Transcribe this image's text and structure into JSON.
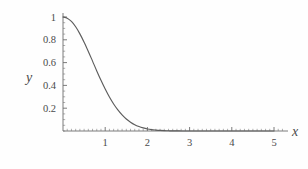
{
  "figure": {
    "background_color": "#fefefe",
    "curve_color": "#5c5c5c",
    "axis_color": "#6d6d6d",
    "text_color": "#4a4a4a"
  },
  "chart_data": {
    "type": "line",
    "title": "",
    "subtitle": "",
    "xlabel": "x",
    "ylabel": "y",
    "xlim": [
      0,
      5.2
    ],
    "ylim": [
      0,
      1.05
    ],
    "grid": false,
    "legend": null,
    "legend_position": "none",
    "frame": false,
    "xticks": [
      1,
      2,
      3,
      4,
      5
    ],
    "xtick_labels": [
      "1",
      "2",
      "3",
      "4",
      "5"
    ],
    "yticks": [
      0.2,
      0.4,
      0.6,
      0.8,
      1
    ],
    "ytick_labels": [
      "0.2",
      "0.4",
      "0.6",
      "0.8",
      "1"
    ],
    "x_minor_tick_step": 0.1,
    "y_minor_tick_step": 0.05,
    "series": [
      {
        "name": "y = exp(-x^2)",
        "x": [
          0,
          0.1,
          0.2,
          0.3,
          0.4,
          0.5,
          0.6,
          0.7,
          0.8,
          0.9,
          1,
          1.1,
          1.2,
          1.3,
          1.4,
          1.5,
          1.6,
          1.7,
          1.8,
          1.9,
          2,
          2.1,
          2.2,
          2.3,
          2.4,
          2.5,
          2.6,
          2.7,
          2.8,
          2.9,
          3,
          3.2,
          3.4,
          3.6,
          3.8,
          4,
          4.25,
          4.5,
          4.75,
          5
        ],
        "values": [
          1,
          0.99,
          0.961,
          0.914,
          0.852,
          0.779,
          0.698,
          0.613,
          0.527,
          0.445,
          0.368,
          0.298,
          0.237,
          0.185,
          0.141,
          0.105,
          0.077,
          0.055,
          0.039,
          0.027,
          0.018,
          0.012,
          0.008,
          0.005,
          0.003,
          0.002,
          0.001,
          0.001,
          0,
          0,
          0,
          0,
          0,
          0,
          0,
          0,
          0,
          0,
          0,
          0
        ]
      }
    ]
  },
  "axis_titles": {
    "x": "x",
    "y": "y"
  }
}
